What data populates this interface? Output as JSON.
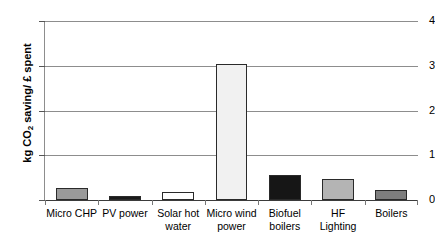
{
  "chart_data": {
    "type": "bar",
    "title": "",
    "subtitle": "",
    "xlabel": "",
    "ylabel": "kg CO2 saving/ £ spent",
    "ylabel_parts": {
      "pre": "kg CO",
      "sub": "2",
      "post": " saving/ £ spent"
    },
    "categories": [
      "Micro CHP",
      "PV power",
      "Solar hot water",
      "Micro wind power",
      "Biofuel boilers",
      "HF Lighting",
      "Boilers"
    ],
    "category_lines": [
      [
        "Micro CHP"
      ],
      [
        "PV power"
      ],
      [
        "Solar hot",
        "water"
      ],
      [
        "Micro wind",
        "power"
      ],
      [
        "Biofuel",
        "boilers"
      ],
      [
        "HF",
        "Lighting"
      ],
      [
        "Boilers"
      ]
    ],
    "values": [
      0.26,
      0.09,
      0.18,
      3.03,
      0.55,
      0.48,
      0.22
    ],
    "bar_colors": [
      "#9a9a9a",
      "#1b1b1b",
      "#ffffff",
      "#f1f1f1",
      "#161616",
      "#b4b4b4",
      "#7e7e7e"
    ],
    "bar_border_color": "#2a2a2a",
    "ylim": [
      0,
      4
    ],
    "yticks": [
      0,
      1,
      2,
      3,
      4
    ],
    "ytick_labels": [
      "0",
      "1",
      "2",
      "3",
      "4"
    ],
    "grid": true,
    "grid_color": "#8d8d8d",
    "legend": null,
    "legend_position": "none",
    "annotations": []
  }
}
